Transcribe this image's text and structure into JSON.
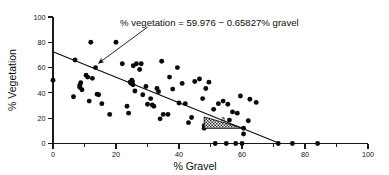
{
  "chart_data": {
    "type": "scatter",
    "title": "",
    "xlabel": "% Gravel",
    "ylabel": "% Vegetation",
    "xlim": [
      0,
      100
    ],
    "ylim": [
      0,
      100
    ],
    "xticks": [
      0,
      10,
      20,
      30,
      40,
      50,
      60,
      70,
      80,
      90,
      100
    ],
    "xtick_labels": [
      "0",
      "",
      "20",
      "",
      "40",
      "",
      "60",
      "",
      "80",
      "",
      "100"
    ],
    "xtick_labeled": [
      {
        "value": 0,
        "label": "0"
      },
      {
        "value": 20,
        "label": "20"
      },
      {
        "value": 40,
        "label": "40"
      },
      {
        "value": 60,
        "label": "60"
      },
      {
        "value": 80,
        "label": "80"
      },
      {
        "value": 100,
        "label": "100"
      }
    ],
    "yticks": [
      0,
      20,
      40,
      60,
      80,
      100
    ],
    "ytick_labels": [
      "0",
      "20",
      "40",
      "60",
      "80",
      "100"
    ],
    "grid": false,
    "legend": null,
    "annotations": [
      {
        "name": "regression-equation",
        "text": "% vegetation = 59.976 − 0.65827% gravel",
        "x": 30,
        "y": 92,
        "arrow_to": {
          "x": 14.5,
          "y": 63.5
        }
      },
      {
        "name": "region-a-label",
        "text": "a",
        "x": 54,
        "y": 18
      }
    ],
    "fit_line": {
      "name": "least-squares-regression-line",
      "intercept": 59.976,
      "slope": -0.65827,
      "equation": "% vegetation = 59.976 − 0.65827% gravel",
      "x_start": 0,
      "y_start": 72.5,
      "x_end": 72,
      "y_end": 0,
      "x_intercept": 72
    },
    "shaded_region": {
      "name": "hatched-triangle-a",
      "label": "a",
      "pattern": "stippled-hatch",
      "vertices": [
        {
          "x": 48.0,
          "y": 12.0
        },
        {
          "x": 48.0,
          "y": 21.0
        },
        {
          "x": 60.5,
          "y": 12.0
        }
      ]
    },
    "series": [
      {
        "name": "vegetation-vs-gravel",
        "marker": "filled-circle",
        "color": "#0a0a0a",
        "points": [
          [
            0.0,
            50.0
          ],
          [
            6.5,
            37.0
          ],
          [
            7.0,
            66.0
          ],
          [
            8.5,
            46.0
          ],
          [
            8.5,
            44.5
          ],
          [
            8.8,
            48.0
          ],
          [
            9.2,
            42.5
          ],
          [
            10.5,
            54.0
          ],
          [
            11.0,
            52.5
          ],
          [
            11.5,
            33.5
          ],
          [
            12.0,
            80.0
          ],
          [
            12.5,
            51.5
          ],
          [
            13.5,
            60.0
          ],
          [
            14.0,
            39.0
          ],
          [
            14.5,
            38.5
          ],
          [
            15.5,
            31.5
          ],
          [
            18.0,
            23.0
          ],
          [
            20.0,
            80.0
          ],
          [
            22.0,
            63.0
          ],
          [
            23.5,
            29.5
          ],
          [
            24.0,
            24.0
          ],
          [
            24.5,
            48.5
          ],
          [
            24.8,
            47.5
          ],
          [
            25.0,
            50.0
          ],
          [
            25.2,
            49.0
          ],
          [
            25.4,
            46.5
          ],
          [
            25.5,
            61.5
          ],
          [
            26.0,
            41.5
          ],
          [
            26.5,
            63.0
          ],
          [
            27.5,
            58.5
          ],
          [
            28.0,
            63.0
          ],
          [
            28.5,
            38.5
          ],
          [
            29.5,
            45.0
          ],
          [
            30.0,
            31.0
          ],
          [
            31.0,
            35.5
          ],
          [
            31.5,
            30.5
          ],
          [
            32.0,
            29.5
          ],
          [
            33.0,
            43.5
          ],
          [
            33.5,
            41.0
          ],
          [
            34.0,
            19.5
          ],
          [
            34.5,
            65.0
          ],
          [
            35.0,
            23.0
          ],
          [
            36.5,
            23.0
          ],
          [
            37.0,
            52.5
          ],
          [
            38.0,
            43.0
          ],
          [
            39.5,
            60.0
          ],
          [
            40.0,
            32.0
          ],
          [
            41.0,
            47.5
          ],
          [
            42.0,
            31.5
          ],
          [
            43.0,
            16.5
          ],
          [
            44.0,
            20.5
          ],
          [
            45.0,
            49.0
          ],
          [
            46.5,
            51.0
          ],
          [
            47.5,
            35.5
          ],
          [
            48.0,
            12.0
          ],
          [
            48.0,
            14.0
          ],
          [
            48.5,
            43.5
          ],
          [
            49.5,
            48.5
          ],
          [
            51.0,
            27.0
          ],
          [
            51.5,
            0.0
          ],
          [
            52.5,
            31.5
          ],
          [
            54.0,
            33.5
          ],
          [
            55.0,
            0.0
          ],
          [
            55.5,
            31.0
          ],
          [
            56.0,
            18.5
          ],
          [
            57.0,
            25.0
          ],
          [
            58.0,
            0.0
          ],
          [
            58.5,
            24.0
          ],
          [
            59.5,
            37.5
          ],
          [
            60.0,
            0.0
          ],
          [
            60.5,
            12.0
          ],
          [
            60.5,
            7.5
          ],
          [
            62.0,
            18.0
          ],
          [
            62.5,
            35.0
          ],
          [
            64.5,
            32.5
          ],
          [
            71.5,
            0.0
          ],
          [
            76.0,
            0.0
          ],
          [
            84.0,
            0.0
          ]
        ]
      }
    ]
  },
  "axes": {
    "x_label": "% Gravel",
    "y_label": "% Vegetation"
  }
}
